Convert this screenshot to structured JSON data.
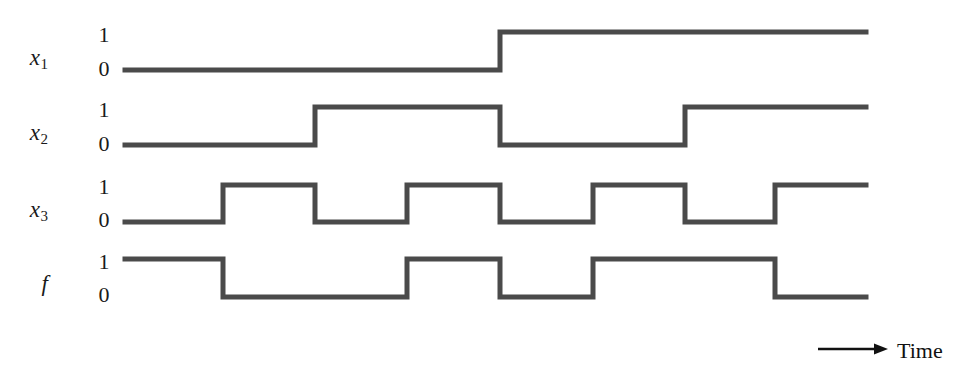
{
  "figure": {
    "type": "timing-diagram",
    "background_color": "#ffffff",
    "trace_color": "#4a4a4a",
    "text_color": "#1a1a1a",
    "time_axis": {
      "label": "Time",
      "arrow_icon": "arrow-right-icon",
      "arrow_x1": 818,
      "arrow_x2": 888,
      "arrow_y": 349,
      "label_x": 897,
      "label_y": 340
    }
  },
  "geometry": {
    "x_start": 125,
    "x_end": 866,
    "interval_edges": [
      125,
      223,
      315,
      407,
      500,
      593,
      685,
      775,
      866
    ],
    "stroke_width": 5
  },
  "signals": [
    {
      "name": "x1",
      "label_base": "x",
      "label_sub": "1",
      "label_x": 48,
      "label_y": 46,
      "high_y": 32,
      "low_y": 70,
      "level_high_text": "1",
      "level_low_text": "0",
      "level_high_x": 93,
      "level_high_y": 24,
      "level_low_x": 93,
      "level_low_y": 58,
      "values": [
        0,
        0,
        0,
        0,
        1,
        1,
        1,
        1
      ]
    },
    {
      "name": "x2",
      "label_base": "x",
      "label_sub": "2",
      "label_x": 48,
      "label_y": 121,
      "high_y": 107,
      "low_y": 145,
      "level_high_text": "1",
      "level_low_text": "0",
      "level_high_x": 93,
      "level_high_y": 99,
      "level_low_x": 93,
      "level_low_y": 133,
      "values": [
        0,
        0,
        1,
        1,
        0,
        0,
        1,
        1
      ]
    },
    {
      "name": "x3",
      "label_base": "x",
      "label_sub": "3",
      "label_x": 48,
      "label_y": 198,
      "high_y": 185,
      "low_y": 222,
      "level_high_text": "1",
      "level_low_text": "0",
      "level_high_x": 93,
      "level_high_y": 176,
      "level_low_x": 93,
      "level_low_y": 209,
      "values": [
        0,
        1,
        0,
        1,
        0,
        1,
        0,
        1
      ]
    },
    {
      "name": "f",
      "label_base": "f",
      "label_sub": "",
      "label_x": 48,
      "label_y": 272,
      "high_y": 259,
      "low_y": 297,
      "level_high_text": "1",
      "level_low_text": "0",
      "level_high_x": 93,
      "level_high_y": 251,
      "level_low_x": 93,
      "level_low_y": 284,
      "values": [
        1,
        0,
        0,
        1,
        0,
        1,
        1,
        0
      ]
    }
  ],
  "chart_data": {
    "type": "line",
    "title": "",
    "xlabel": "Time",
    "ylabel": "",
    "categories": [
      "t0",
      "t1",
      "t2",
      "t3",
      "t4",
      "t5",
      "t6",
      "t7"
    ],
    "series": [
      {
        "name": "x1",
        "values": [
          0,
          0,
          0,
          0,
          1,
          1,
          1,
          1
        ]
      },
      {
        "name": "x2",
        "values": [
          0,
          0,
          1,
          1,
          0,
          0,
          1,
          1
        ]
      },
      {
        "name": "x3",
        "values": [
          0,
          1,
          0,
          1,
          0,
          1,
          0,
          1
        ]
      },
      {
        "name": "f",
        "values": [
          1,
          0,
          0,
          1,
          0,
          1,
          1,
          0
        ]
      }
    ],
    "ylim": [
      0,
      1
    ],
    "grid": false,
    "legend_position": "left-labels"
  }
}
